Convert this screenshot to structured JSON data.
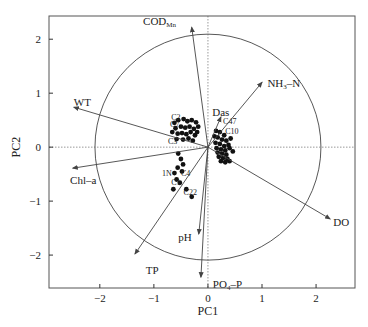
{
  "chart_data": {
    "type": "scatter",
    "subtype": "pca-biplot",
    "title": "",
    "xlabel": "PC1",
    "ylabel": "PC2",
    "xlim": [
      -2.94,
      2.72
    ],
    "ylim": [
      -2.61,
      2.43
    ],
    "xticks": [
      -2,
      -1,
      0,
      1,
      2
    ],
    "yticks": [
      -2,
      -1,
      0,
      1,
      2
    ],
    "xtick_labels": [
      "−2",
      "−1",
      "0",
      "1",
      "2"
    ],
    "ytick_labels": [
      "−2",
      "−1",
      "0",
      "1",
      "2"
    ],
    "grid": false,
    "zero_lines": {
      "style": "dotted",
      "color": "#999999"
    },
    "correlation_circle": {
      "center": [
        0,
        0
      ],
      "radius": 2.09
    },
    "loadings": [
      {
        "name": "COD",
        "sub": "Mn",
        "x": -0.3,
        "y": 2.22,
        "label_dx": -0.9,
        "label_dy": 0.12
      },
      {
        "name": "NH",
        "sub": "3",
        "suffix": "–N",
        "x": 1.0,
        "y": 1.2,
        "label_dx": 0.1,
        "label_dy": -0.02
      },
      {
        "name": "Das",
        "sub": "",
        "x": 0.24,
        "y": 0.56,
        "label_dx": -0.16,
        "label_dy": 0.1
      },
      {
        "name": "WT",
        "sub": "",
        "x": -2.48,
        "y": 0.74,
        "label_dx": 0.0,
        "label_dy": 0.1
      },
      {
        "name": "Chl–a",
        "sub": "",
        "x": -2.5,
        "y": -0.39,
        "label_dx": -0.05,
        "label_dy": -0.22
      },
      {
        "name": "TP",
        "sub": "",
        "x": -1.35,
        "y": -1.98,
        "label_dx": 0.2,
        "label_dy": -0.3
      },
      {
        "name": "pH",
        "sub": "",
        "x": -0.17,
        "y": -1.61,
        "label_dx": -0.38,
        "label_dy": -0.06
      },
      {
        "name": "PO",
        "sub": "4",
        "suffix": "–P",
        "x": -0.13,
        "y": -2.41,
        "label_dx": 0.22,
        "label_dy": -0.12
      },
      {
        "name": "DO",
        "sub": "",
        "x": 2.26,
        "y": -1.33,
        "label_dx": 0.06,
        "label_dy": -0.06
      }
    ],
    "sample_labels": [
      {
        "text": "C2",
        "x": -0.68,
        "y": 0.5
      },
      {
        "text": "C7",
        "x": -0.7,
        "y": 0.38
      },
      {
        "text": "C3",
        "x": -0.74,
        "y": 0.06
      },
      {
        "text": "1N",
        "x": -0.85,
        "y": -0.53
      },
      {
        "text": "C1",
        "x": -0.68,
        "y": -0.7
      },
      {
        "text": "C4",
        "x": -0.5,
        "y": -0.53
      },
      {
        "text": "C22",
        "x": -0.45,
        "y": -0.88
      },
      {
        "text": "C47",
        "x": 0.28,
        "y": 0.42
      },
      {
        "text": "C10",
        "x": 0.32,
        "y": 0.25
      }
    ],
    "samples": [
      {
        "x": -0.62,
        "y": 0.45
      },
      {
        "x": -0.55,
        "y": 0.5
      },
      {
        "x": -0.45,
        "y": 0.52
      },
      {
        "x": -0.38,
        "y": 0.48
      },
      {
        "x": -0.3,
        "y": 0.5
      },
      {
        "x": -0.22,
        "y": 0.46
      },
      {
        "x": -0.6,
        "y": 0.35
      },
      {
        "x": -0.5,
        "y": 0.38
      },
      {
        "x": -0.42,
        "y": 0.36
      },
      {
        "x": -0.34,
        "y": 0.38
      },
      {
        "x": -0.26,
        "y": 0.34
      },
      {
        "x": -0.18,
        "y": 0.38
      },
      {
        "x": -0.56,
        "y": 0.25
      },
      {
        "x": -0.48,
        "y": 0.26
      },
      {
        "x": -0.4,
        "y": 0.24
      },
      {
        "x": -0.32,
        "y": 0.28
      },
      {
        "x": -0.24,
        "y": 0.22
      },
      {
        "x": -0.58,
        "y": 0.15
      },
      {
        "x": -0.46,
        "y": 0.14
      },
      {
        "x": -0.36,
        "y": 0.16
      },
      {
        "x": -0.28,
        "y": 0.12
      },
      {
        "x": -0.66,
        "y": 0.28
      },
      {
        "x": -0.2,
        "y": 0.28
      },
      {
        "x": -0.55,
        "y": -0.12
      },
      {
        "x": -0.5,
        "y": -0.22
      },
      {
        "x": -0.46,
        "y": -0.32
      },
      {
        "x": -0.56,
        "y": -0.38
      },
      {
        "x": -0.48,
        "y": -0.45
      },
      {
        "x": -0.62,
        "y": -0.48
      },
      {
        "x": -0.58,
        "y": -0.6
      },
      {
        "x": -0.52,
        "y": -0.66
      },
      {
        "x": -0.64,
        "y": -0.78
      },
      {
        "x": -0.4,
        "y": -0.78
      },
      {
        "x": -0.3,
        "y": -0.92
      },
      {
        "x": 0.15,
        "y": 0.3
      },
      {
        "x": 0.22,
        "y": 0.28
      },
      {
        "x": 0.3,
        "y": 0.22
      },
      {
        "x": 0.18,
        "y": 0.18
      },
      {
        "x": 0.26,
        "y": 0.14
      },
      {
        "x": 0.34,
        "y": 0.12
      },
      {
        "x": 0.14,
        "y": 0.08
      },
      {
        "x": 0.22,
        "y": 0.06
      },
      {
        "x": 0.3,
        "y": 0.02
      },
      {
        "x": 0.38,
        "y": 0.04
      },
      {
        "x": 0.16,
        "y": -0.02
      },
      {
        "x": 0.24,
        "y": -0.04
      },
      {
        "x": 0.32,
        "y": -0.06
      },
      {
        "x": 0.4,
        "y": -0.02
      },
      {
        "x": 0.18,
        "y": -0.1
      },
      {
        "x": 0.26,
        "y": -0.12
      },
      {
        "x": 0.34,
        "y": -0.14
      },
      {
        "x": 0.2,
        "y": -0.18
      },
      {
        "x": 0.28,
        "y": -0.2
      },
      {
        "x": 0.36,
        "y": -0.22
      },
      {
        "x": 0.24,
        "y": -0.26
      },
      {
        "x": 0.32,
        "y": -0.28
      },
      {
        "x": 0.42,
        "y": 0.16
      },
      {
        "x": 0.12,
        "y": 0.2
      },
      {
        "x": 0.46,
        "y": -0.08
      },
      {
        "x": 0.4,
        "y": -0.26
      }
    ],
    "colors": {
      "axis": "#333333",
      "arrow": "#444444",
      "circle": "#444444",
      "point": "#111111",
      "zero_line": "#999999"
    }
  }
}
